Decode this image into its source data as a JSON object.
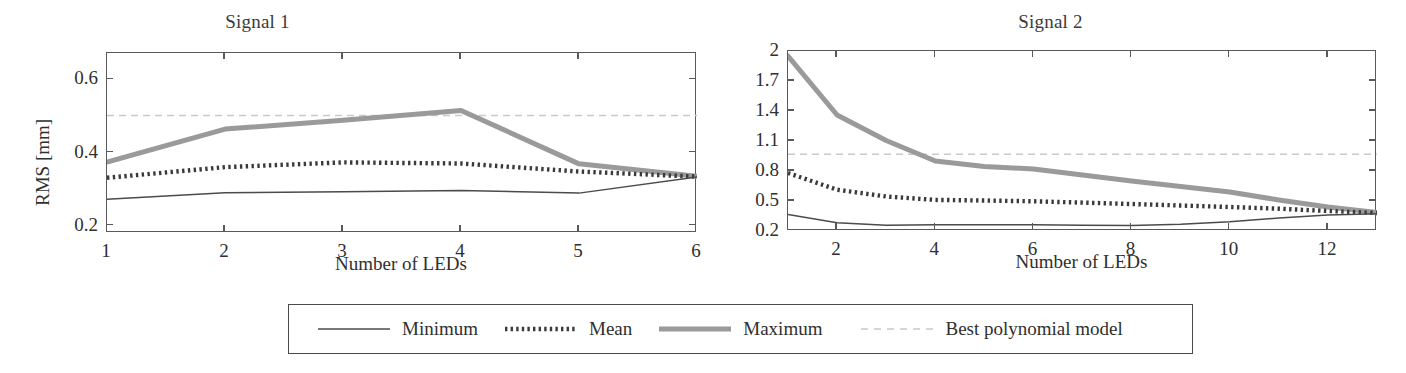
{
  "figure": {
    "background": "#ffffff",
    "axis_color": "#59595c",
    "text_color": "#2f2f2f"
  },
  "colors": {
    "minimum": "#4b4b4b",
    "mean": "#3a3a3a",
    "maximum": "#9a9a9a",
    "best_polynomial_model": "#c9c9c9"
  },
  "legend": {
    "entries": [
      {
        "label": "Minimum",
        "style": "solid-thin",
        "color": "#4b4b4b"
      },
      {
        "label": "Mean",
        "style": "dotted-thick",
        "color": "#3a3a3a"
      },
      {
        "label": "Maximum",
        "style": "solid-thick",
        "color": "#9a9a9a"
      },
      {
        "label": "Best polynomial model",
        "style": "dashed-thin",
        "color": "#c9c9c9"
      }
    ]
  },
  "chart_data": [
    {
      "id": "signal-1",
      "type": "line",
      "title": "Signal 1",
      "xlabel": "Number of LEDs",
      "ylabel": "RMS [mm]",
      "xlim": [
        1,
        6
      ],
      "ylim": [
        0.18,
        0.672
      ],
      "xticks": [
        1,
        2,
        3,
        4,
        5,
        6
      ],
      "xticklabels": [
        "1",
        "2",
        "3",
        "4",
        "5",
        "6"
      ],
      "yticks": [
        0.2,
        0.4,
        0.6
      ],
      "yticklabels": [
        "0.2",
        "0.4",
        "0.6"
      ],
      "grid": false,
      "legend_position": "below-figure",
      "x": [
        1,
        2,
        3,
        4,
        5,
        6
      ],
      "series": [
        {
          "name": "Minimum",
          "values": [
            0.272,
            0.29,
            0.293,
            0.296,
            0.289,
            0.333
          ]
        },
        {
          "name": "Mean",
          "values": [
            0.331,
            0.36,
            0.373,
            0.37,
            0.348,
            0.334
          ]
        },
        {
          "name": "Maximum",
          "values": [
            0.374,
            0.464,
            0.488,
            0.515,
            0.369,
            0.335
          ]
        }
      ],
      "reference_line": {
        "name": "Best polynomial model",
        "value": 0.501
      }
    },
    {
      "id": "signal-2",
      "type": "line",
      "title": "Signal 2",
      "xlabel": "Number of LEDs",
      "ylabel": "",
      "xlim": [
        1,
        13
      ],
      "ylim": [
        0.2,
        2.0
      ],
      "xticks": [
        2,
        4,
        6,
        8,
        10,
        12
      ],
      "xticklabels": [
        "2",
        "4",
        "6",
        "8",
        "10",
        "12"
      ],
      "yticks": [
        0.2,
        0.5,
        0.8,
        1.1,
        1.4,
        1.7,
        2.0
      ],
      "yticklabels": [
        "0.2",
        "0.5",
        "0.8",
        "1.1",
        "1.4",
        "1.7",
        "2"
      ],
      "grid": false,
      "legend_position": "below-figure",
      "x": [
        1,
        2,
        3,
        4,
        5,
        6,
        7,
        8,
        9,
        10,
        11,
        12,
        13
      ],
      "series": [
        {
          "name": "Minimum",
          "values": [
            0.365,
            0.283,
            0.258,
            0.262,
            0.263,
            0.262,
            0.258,
            0.255,
            0.268,
            0.292,
            0.33,
            0.36,
            0.372
          ]
        },
        {
          "name": "Mean",
          "values": [
            0.78,
            0.613,
            0.545,
            0.511,
            0.505,
            0.497,
            0.484,
            0.47,
            0.455,
            0.44,
            0.423,
            0.4,
            0.38
          ]
        },
        {
          "name": "Maximum",
          "values": [
            1.95,
            1.36,
            1.105,
            0.9,
            0.845,
            0.82,
            0.76,
            0.7,
            0.645,
            0.59,
            0.51,
            0.44,
            0.385
          ]
        }
      ],
      "reference_line": {
        "name": "Best polynomial model",
        "value": 0.968
      }
    }
  ]
}
